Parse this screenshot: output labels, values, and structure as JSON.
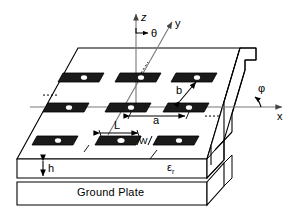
{
  "figure": {
    "type": "technical-diagram",
    "axes": {
      "z_label": "z",
      "y_label": "y",
      "x_label": "x",
      "theta_label": "θ",
      "phi_label": "φ"
    },
    "dimensions": {
      "a_label": "a",
      "b_label": "b",
      "L_label": "L",
      "W_label": "W",
      "h_label": "h"
    },
    "materials": {
      "substrate_label": "ε",
      "substrate_subscript": "r",
      "ground_plate_label": "Ground Plate"
    },
    "ellipsis": {
      "left": "····",
      "right": "····"
    },
    "array": {
      "rows": 3,
      "columns": 3,
      "patch_fill": "#1a1a1a",
      "slot_fill": "#ffffff"
    },
    "colors": {
      "stroke": "#000000",
      "axis": "#555555",
      "background": "#ffffff",
      "substrate_face": "#ffffff"
    }
  }
}
